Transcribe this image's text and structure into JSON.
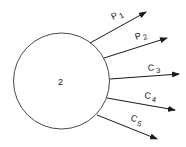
{
  "diagram": {
    "node": {
      "label": "2",
      "cx": 61.5,
      "cy": 81,
      "r": 48
    },
    "arrows": [
      {
        "id": "p1",
        "letter": "P",
        "sub": "1",
        "x1": 90,
        "y1": 43,
        "x2": 146,
        "y2": 12,
        "lx": 113,
        "ly": 20,
        "rot": -27
      },
      {
        "id": "p2",
        "letter": "P",
        "sub": "2",
        "x1": 104,
        "y1": 58,
        "x2": 167,
        "y2": 38,
        "lx": 136,
        "ly": 40,
        "rot": -18
      },
      {
        "id": "c3",
        "letter": "C",
        "sub": "3",
        "x1": 110,
        "y1": 79,
        "x2": 179,
        "y2": 74,
        "lx": 148,
        "ly": 71,
        "rot": -4
      },
      {
        "id": "c4",
        "letter": "C",
        "sub": "4",
        "x1": 107,
        "y1": 98,
        "x2": 175,
        "y2": 110,
        "lx": 144,
        "ly": 98,
        "rot": 10
      },
      {
        "id": "c5",
        "letter": "C",
        "sub": "5",
        "x1": 97,
        "y1": 115,
        "x2": 157,
        "y2": 139,
        "lx": 130,
        "ly": 120,
        "rot": 22
      }
    ]
  }
}
